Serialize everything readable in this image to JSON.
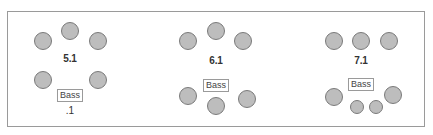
{
  "diagram": {
    "border_color": "#9a9a9a",
    "speaker_fill": "#bdbdbd",
    "speaker_stroke": "#7a7a7a",
    "groups": [
      {
        "name": "5.1",
        "label": "5.1",
        "bass_label": "Bass",
        "sub_label": ".1",
        "speakers_main": 5,
        "subwoofer": 1
      },
      {
        "name": "6.1",
        "label": "6.1",
        "bass_label": "Bass",
        "speakers_main": 6,
        "subwoofer": 1
      },
      {
        "name": "7.1",
        "label": "7.1",
        "bass_label": "Bass",
        "speakers_main": 7,
        "subwoofer": 1
      }
    ]
  }
}
